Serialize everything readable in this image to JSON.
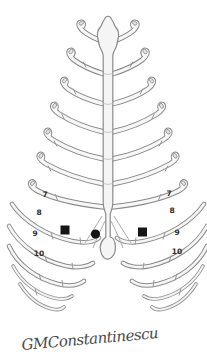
{
  "figure": {
    "paper_color": "#ffffff",
    "ink_color": "#8a8a8a",
    "marker_color": "#161616",
    "label_color": "#2f2f2f"
  },
  "rib_labels": {
    "left": [
      "7",
      "8",
      "9",
      "10"
    ],
    "right": [
      "7",
      "8",
      "9",
      "10"
    ]
  },
  "markers": [
    {
      "name": "left-square-marker",
      "shape": "filled-square"
    },
    {
      "name": "center-dot-marker",
      "shape": "filled-circle"
    },
    {
      "name": "right-square-marker",
      "shape": "filled-square"
    }
  ],
  "signature": "GMConstantinescu"
}
